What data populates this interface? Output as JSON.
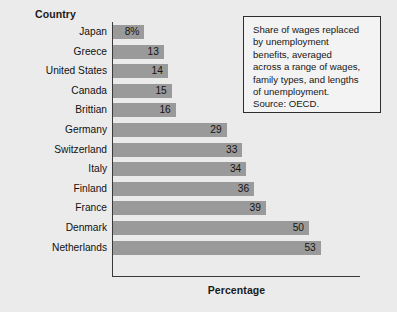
{
  "chart_data": {
    "type": "bar",
    "orientation": "horizontal",
    "title": "",
    "xlabel": "Percentage",
    "ylabel": "Country",
    "categories": [
      "Japan",
      "Greece",
      "United States",
      "Canada",
      "Brittian",
      "Germany",
      "Switzerland",
      "Italy",
      "Finland",
      "France",
      "Denmark",
      "Netherlands"
    ],
    "values": [
      8,
      13,
      14,
      15,
      16,
      29,
      33,
      34,
      36,
      39,
      50,
      53
    ],
    "value_labels": [
      "8%",
      "13",
      "14",
      "15",
      "16",
      "29",
      "33",
      "34",
      "36",
      "39",
      "50",
      "53"
    ],
    "xlim": [
      0,
      63
    ],
    "grid": false,
    "legend": false,
    "bar_color": "#9a9a9a",
    "background_color": "#ebebeb"
  },
  "header": {
    "country_label": "Country"
  },
  "axis": {
    "percentage_label": "Percentage"
  },
  "note": {
    "body": "Share of wages replaced\nby unemployment\nbenefits, averaged\nacross a range of wages,\nfamily types, and lengths\nof unemployment.",
    "source": "Source: OECD."
  }
}
